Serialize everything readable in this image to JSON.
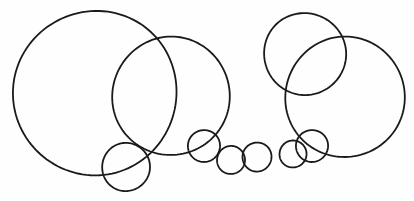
{
  "canvas": {
    "width": 414,
    "height": 201,
    "background_color": "#fefefe",
    "stroke_color": "#1a1a1a",
    "stroke_width": 1.8,
    "fill": "none"
  },
  "chart_data": {
    "type": "scatter",
    "title": "",
    "subtitle": "",
    "xlabel": "",
    "ylabel": "",
    "xlim": [
      0,
      414
    ],
    "ylim": [
      0,
      201
    ],
    "grid": false,
    "legend": null,
    "annotations": [],
    "series": [
      {
        "name": "circles",
        "marker": "open-circle",
        "points": [
          {
            "id": "circle-1",
            "label": "large-left",
            "cx": 95,
            "cy": 93,
            "r": 82
          },
          {
            "id": "circle-2",
            "label": "large-mid-left",
            "cx": 171,
            "cy": 96,
            "r": 59
          },
          {
            "id": "circle-3",
            "label": "small-lower-left",
            "cx": 126,
            "cy": 167,
            "r": 24
          },
          {
            "id": "circle-4",
            "label": "chain-1",
            "cx": 204,
            "cy": 146,
            "r": 16
          },
          {
            "id": "circle-5",
            "label": "chain-2",
            "cx": 231,
            "cy": 160,
            "r": 14
          },
          {
            "id": "circle-6",
            "label": "chain-3",
            "cx": 257,
            "cy": 157,
            "r": 14.5
          },
          {
            "id": "circle-7",
            "label": "chain-4",
            "cx": 293,
            "cy": 154,
            "r": 13.5
          },
          {
            "id": "circle-8",
            "label": "chain-5",
            "cx": 312,
            "cy": 146,
            "r": 16
          },
          {
            "id": "circle-9",
            "label": "upper-right",
            "cx": 305,
            "cy": 54,
            "r": 41
          },
          {
            "id": "circle-10",
            "label": "large-right",
            "cx": 345,
            "cy": 97,
            "r": 60
          }
        ]
      }
    ],
    "counts": {
      "total_circles": 10,
      "large_circles": 4,
      "small_circles": 6
    }
  }
}
